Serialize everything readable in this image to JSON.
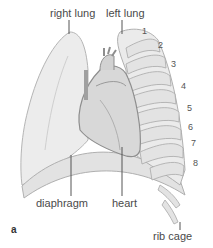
{
  "labels": {
    "right_lung": "right lung",
    "left_lung": "left lung",
    "diaphragm": "diaphragm",
    "heart": "heart",
    "rib_cage": "rib cage",
    "figure_letter": "a"
  },
  "rib_numbers": [
    "1",
    "2",
    "3",
    "4",
    "5",
    "6",
    "7",
    "8"
  ],
  "colors": {
    "lung_fill": "#ececec",
    "heart_fill": "#d6d6d6",
    "rib_fill": "#e4e4e4",
    "outline": "#9a9a9a",
    "leader_line": "#555555"
  }
}
